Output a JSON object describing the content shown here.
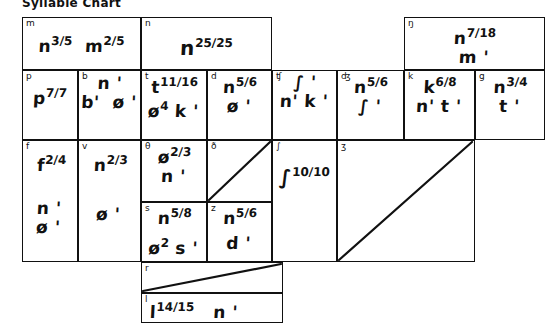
{
  "header": {
    "title_clipped": "Syllable Chart"
  },
  "grid": {
    "line_color": "#111111",
    "cells": [
      {
        "name": "cell-m",
        "label": "m",
        "lines": [
          "n 3/5   m 2/5"
        ]
      },
      {
        "name": "cell-n",
        "label": "n",
        "lines": [
          "n 25/25"
        ]
      },
      {
        "name": "cell-eng",
        "label": "ŋ",
        "lines": [
          "n 7/18",
          "m '"
        ]
      },
      {
        "name": "cell-p",
        "label": "p",
        "lines": [
          "p 7/7"
        ]
      },
      {
        "name": "cell-b",
        "label": "b",
        "lines": [
          "n '",
          "b'  ø '"
        ]
      },
      {
        "name": "cell-t",
        "label": "t",
        "lines": [
          "t 11/16",
          "ø⁴ k '"
        ]
      },
      {
        "name": "cell-d",
        "label": "d",
        "lines": [
          "n 5/6",
          "ø '"
        ]
      },
      {
        "name": "cell-tsh",
        "label": "ʧ",
        "lines": [
          "∫ '",
          "n' k '"
        ]
      },
      {
        "name": "cell-dzh",
        "label": "ʤ",
        "lines": [
          "n 5/6",
          "∫ '"
        ]
      },
      {
        "name": "cell-k",
        "label": "k",
        "lines": [
          "k 6/8",
          "n' t '"
        ]
      },
      {
        "name": "cell-g",
        "label": "g",
        "lines": [
          "n 3/4",
          "t '"
        ]
      },
      {
        "name": "cell-f",
        "label": "f",
        "lines": [
          "f 2/4",
          "n '"
        ]
      },
      {
        "name": "cell-v",
        "label": "v",
        "lines": [
          "n 2/3",
          "ø '"
        ]
      },
      {
        "name": "cell-theta",
        "label": "θ",
        "lines": [
          "ø 2/3",
          "n '"
        ]
      },
      {
        "name": "cell-eth",
        "label": "ð",
        "lines": []
      },
      {
        "name": "cell-s",
        "label": "s",
        "lines": [
          "n 5/8",
          "ø² s '"
        ]
      },
      {
        "name": "cell-z",
        "label": "z",
        "lines": [
          "n 5/6",
          "d '"
        ]
      },
      {
        "name": "cell-esh",
        "label": "∫",
        "lines": [
          "∫ 10/10"
        ]
      },
      {
        "name": "cell-ezh",
        "label": "ʒ",
        "lines": []
      },
      {
        "name": "cell-r",
        "label": "r",
        "lines": []
      },
      {
        "name": "cell-l",
        "label": "l",
        "lines": [
          "l 14/15   n '"
        ]
      }
    ]
  },
  "diagonals": [
    {
      "name": "diagonal-eth",
      "cell": "cell-eth"
    },
    {
      "name": "diagonal-ezh",
      "cell": "cell-ezh"
    },
    {
      "name": "diagonal-r",
      "cell": "cell-r"
    }
  ]
}
